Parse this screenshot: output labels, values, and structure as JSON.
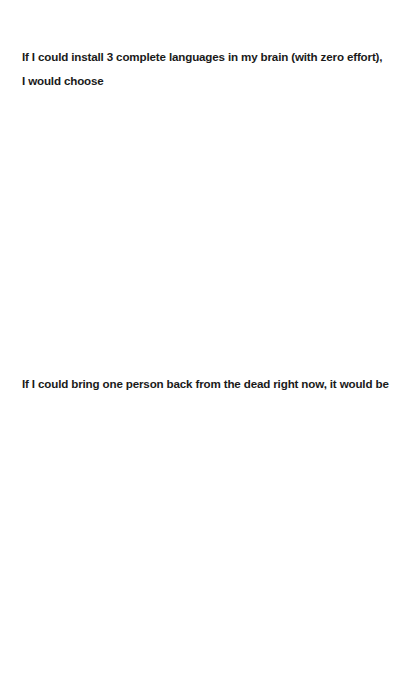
{
  "prompts": [
    {
      "lines": [
        "If I could install 3 complete languages in my brain (with zero effort),",
        "I would choose"
      ],
      "answer": ""
    },
    {
      "lines": [
        "If I could bring one person back from the dead right now, it would be"
      ],
      "answer": ""
    }
  ],
  "colors": {
    "background": "#ffffff",
    "text": "#1a1a1a"
  }
}
